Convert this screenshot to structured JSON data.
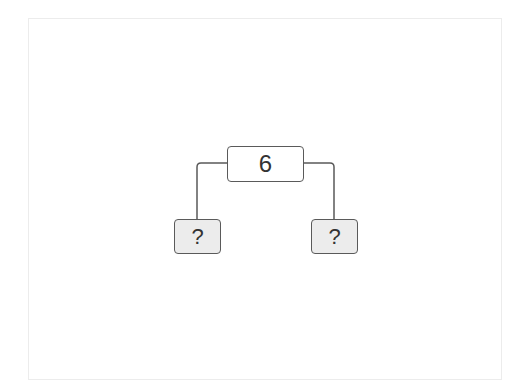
{
  "diagram": {
    "type": "tree",
    "root": {
      "label": "6"
    },
    "children": [
      {
        "label": "?",
        "position": "left"
      },
      {
        "label": "?",
        "position": "right"
      }
    ],
    "colors": {
      "line": "#5a5a5a",
      "root_fill": "#ffffff",
      "leaf_fill": "#ececec",
      "frame_border": "#ececec"
    }
  }
}
